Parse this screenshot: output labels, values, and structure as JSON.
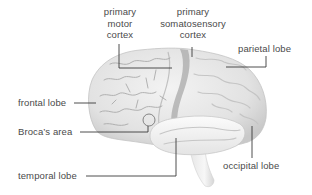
{
  "diagram": {
    "colors": {
      "brain_fill": "#ececec",
      "brain_shadow": "#bdbdbd",
      "sulcus": "#a8a8a8",
      "central_band": "#9e9e9e",
      "leader_line": "#3a3a3a",
      "label_text": "#4a4a4a"
    },
    "labels": {
      "primary_motor_cortex": {
        "line1": "primary",
        "line2": "motor",
        "line3": "cortex"
      },
      "primary_somatosensory_cortex": {
        "line1": "primary",
        "line2": "somatosensory",
        "line3": "cortex"
      },
      "parietal_lobe": "parietal lobe",
      "frontal_lobe": "frontal lobe",
      "brocas_area": "Broca’s area",
      "occipital_lobe": "occipital lobe",
      "temporal_lobe": "temporal lobe"
    }
  }
}
